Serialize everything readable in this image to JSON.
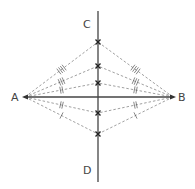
{
  "diagram": {
    "labels": {
      "A": "A",
      "B": "B",
      "C": "C",
      "D": "D"
    },
    "colors": {
      "line": "#444444",
      "dashed": "#888888",
      "point": "#222222"
    },
    "points": {
      "A": [
        25,
        97
      ],
      "B": [
        173,
        97
      ],
      "C_top": [
        98,
        11
      ],
      "D_bottom": [
        98,
        182
      ]
    },
    "bisector_points": [
      {
        "y": 42,
        "ticks": 4
      },
      {
        "y": 66,
        "ticks": 3
      },
      {
        "y": 83,
        "ticks": 2
      },
      {
        "y": 113,
        "ticks": 2
      },
      {
        "y": 134,
        "ticks": 1
      }
    ]
  }
}
